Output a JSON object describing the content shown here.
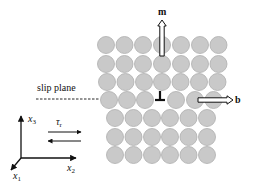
{
  "diagram": {
    "labels": {
      "slip_plane": "slip plane",
      "m": "m",
      "b": "b",
      "x1_base": "x",
      "x1_sub": "1",
      "x2_base": "x",
      "x2_sub": "2",
      "x3_base": "x",
      "x3_sub": "3",
      "tau_base": "τ",
      "tau_sub": "r"
    },
    "colors": {
      "atom_fill": "#c9c9c9",
      "atom_stroke": "#aeaeae",
      "line": "#111111",
      "background": "#ffffff"
    },
    "atom_radius": 8.5,
    "atom_rows": [
      {
        "y": 45,
        "x": [
          106,
          124.5,
          143,
          162,
          181,
          200,
          218.5
        ]
      },
      {
        "y": 64,
        "x": [
          106,
          124.5,
          143,
          162,
          181,
          200,
          218.5
        ]
      },
      {
        "y": 82,
        "x": [
          107,
          125.5,
          144,
          162,
          180.5,
          199,
          217.5
        ]
      },
      {
        "y": 100,
        "x": [
          109,
          127,
          145,
          176,
          195,
          213.5
        ]
      },
      {
        "y": 118,
        "x": [
          115,
          133.5,
          152,
          170,
          188.5,
          207
        ]
      },
      {
        "y": 137,
        "x": [
          115,
          133.5,
          152,
          170,
          188.5,
          207
        ]
      },
      {
        "y": 155,
        "x": [
          115,
          133.5,
          152,
          170,
          188.5,
          207
        ]
      }
    ],
    "dislocation_symbol": {
      "x": 160,
      "y": 98,
      "glyph": "⊥"
    },
    "m_vector": {
      "x": 162,
      "y_start": 56,
      "y_end": 20
    },
    "b_vector": {
      "y": 100,
      "x_start": 198,
      "x_end": 233
    },
    "slip_plane_line": {
      "y": 99,
      "x_start": 36,
      "x_end": 99
    },
    "axes": {
      "origin": [
        21,
        158
      ],
      "x3_end": [
        21,
        116
      ],
      "x2_end": [
        76,
        158
      ],
      "x1_end": [
        11,
        170
      ]
    },
    "shear_arrows": {
      "upper": {
        "y": 132,
        "x_start": 48,
        "x_end": 81,
        "direction": "right"
      },
      "lower": {
        "y": 141,
        "x_start": 81,
        "x_end": 48,
        "direction": "left"
      }
    }
  }
}
